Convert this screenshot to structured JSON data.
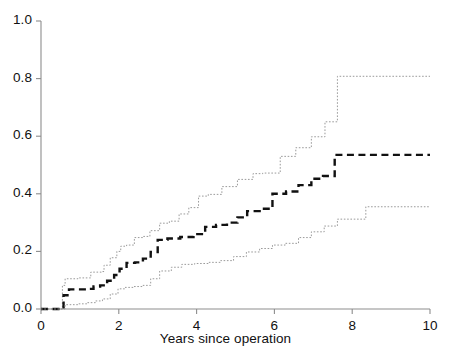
{
  "chart_data": {
    "type": "line",
    "title": "",
    "subtitle": "",
    "xlabel": "Years since operation",
    "ylabel": "",
    "xlim": [
      0,
      10
    ],
    "ylim": [
      0,
      1
    ],
    "xticks": [
      0,
      2,
      4,
      6,
      8,
      10
    ],
    "xtick_labels": [
      "0",
      "2",
      "4",
      "6",
      "8",
      "10"
    ],
    "yticks": [
      0.0,
      0.2,
      0.4,
      0.6,
      0.8,
      1.0
    ],
    "ytick_labels": [
      "0.0",
      "0.2",
      "0.4",
      "0.6",
      "0.8",
      "1.0"
    ],
    "grid": false,
    "legend": null,
    "step_style": "post",
    "annotations": [],
    "series": [
      {
        "name": "upper-confidence-band",
        "style": "dotted",
        "color": "#9a9a9a",
        "width": 1,
        "x": [
          0.0,
          0.52,
          0.55,
          0.62,
          0.95,
          1.25,
          1.28,
          1.55,
          1.62,
          1.78,
          1.95,
          2.05,
          2.2,
          2.4,
          2.62,
          2.8,
          3.05,
          3.3,
          3.55,
          3.8,
          4.05,
          4.3,
          4.65,
          5.05,
          5.45,
          5.7,
          6.15,
          6.55,
          6.95,
          7.3,
          7.62,
          10.0
        ],
        "y": [
          0.0,
          0.0,
          0.082,
          0.105,
          0.108,
          0.108,
          0.128,
          0.13,
          0.152,
          0.178,
          0.2,
          0.218,
          0.222,
          0.248,
          0.252,
          0.272,
          0.298,
          0.305,
          0.33,
          0.352,
          0.392,
          0.398,
          0.425,
          0.45,
          0.47,
          0.472,
          0.53,
          0.56,
          0.598,
          0.65,
          0.808,
          0.808
        ]
      },
      {
        "name": "cumulative-incidence-estimate",
        "style": "dashed",
        "color": "#111111",
        "width": 2.4,
        "x": [
          0.0,
          0.55,
          0.58,
          0.72,
          1.2,
          1.35,
          1.52,
          1.7,
          1.88,
          2.02,
          2.2,
          2.42,
          2.62,
          2.82,
          3.0,
          3.25,
          3.58,
          3.92,
          4.22,
          4.5,
          4.78,
          5.05,
          5.3,
          5.62,
          5.95,
          6.3,
          6.62,
          6.95,
          7.25,
          7.55,
          10.0
        ],
        "y": [
          0.0,
          0.0,
          0.048,
          0.068,
          0.07,
          0.078,
          0.082,
          0.098,
          0.118,
          0.14,
          0.16,
          0.162,
          0.175,
          0.198,
          0.24,
          0.245,
          0.25,
          0.26,
          0.285,
          0.292,
          0.3,
          0.318,
          0.34,
          0.348,
          0.4,
          0.408,
          0.43,
          0.452,
          0.462,
          0.535,
          0.535
        ]
      },
      {
        "name": "lower-confidence-band",
        "style": "dotted",
        "color": "#9a9a9a",
        "width": 1,
        "x": [
          0.0,
          0.58,
          0.62,
          0.95,
          1.18,
          1.4,
          1.58,
          1.78,
          1.98,
          2.15,
          2.38,
          2.6,
          2.82,
          3.05,
          3.35,
          3.62,
          3.95,
          4.3,
          4.62,
          4.95,
          5.28,
          5.62,
          5.95,
          6.28,
          6.62,
          6.95,
          7.28,
          7.62,
          8.35,
          10.0
        ],
        "y": [
          0.0,
          0.0,
          0.015,
          0.018,
          0.022,
          0.028,
          0.035,
          0.052,
          0.07,
          0.075,
          0.078,
          0.082,
          0.105,
          0.132,
          0.145,
          0.155,
          0.158,
          0.162,
          0.168,
          0.182,
          0.198,
          0.21,
          0.222,
          0.228,
          0.248,
          0.268,
          0.288,
          0.312,
          0.355,
          0.355
        ]
      }
    ]
  },
  "axes": {
    "left_px": 41,
    "right_px": 430,
    "top_px": 21,
    "bottom_px": 309,
    "axis_color": "#8d8d8d"
  }
}
